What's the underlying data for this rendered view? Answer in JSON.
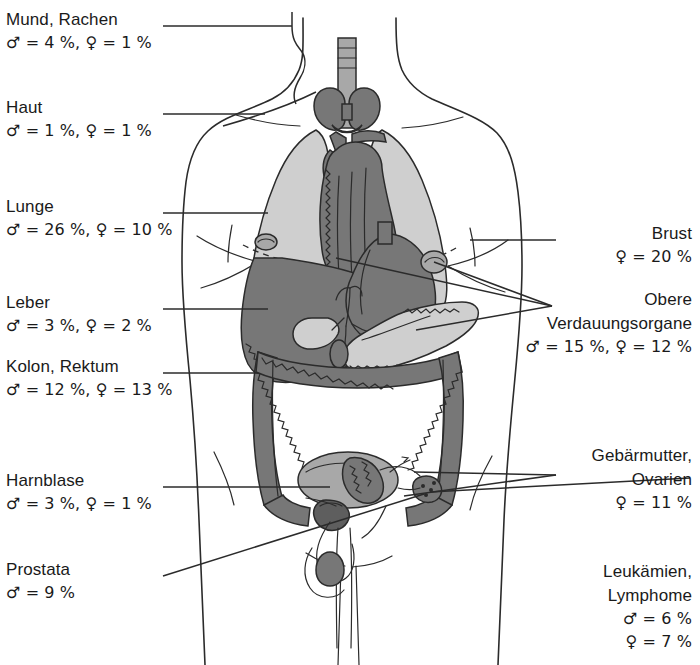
{
  "figure": {
    "colors": {
      "outline": "#2b2b2b",
      "organ_light": "#cfcfcf",
      "organ_mid": "#a8a8a8",
      "organ_dark": "#777777",
      "organ_darker": "#5e5e5e",
      "background": "#ffffff",
      "text": "#1a1a1a"
    },
    "symbols": {
      "male": "♂",
      "female": "♀"
    }
  },
  "labels_left": [
    {
      "name": "mund-rachen",
      "title": "Mund, Rachen",
      "stats": "♂ = 4 %, ♀ = 1 %",
      "male_pct": 4,
      "female_pct": 1
    },
    {
      "name": "haut",
      "title": "Haut",
      "stats": "♂ = 1 %, ♀ = 1 %",
      "male_pct": 1,
      "female_pct": 1
    },
    {
      "name": "lunge",
      "title": "Lunge",
      "stats": "♂ = 26 %, ♀ = 10 %",
      "male_pct": 26,
      "female_pct": 10
    },
    {
      "name": "leber",
      "title": "Leber",
      "stats": "♂ = 3 %, ♀ = 2 %",
      "male_pct": 3,
      "female_pct": 2
    },
    {
      "name": "kolon-rektum",
      "title": "Kolon, Rektum",
      "stats": "♂ = 12 %, ♀  = 13 %",
      "male_pct": 12,
      "female_pct": 13
    },
    {
      "name": "harnblase",
      "title": "Harnblase",
      "stats": "♂ = 3 %, ♀  = 1 %",
      "male_pct": 3,
      "female_pct": 1
    },
    {
      "name": "prostata",
      "title": "Prostata",
      "stats": "♂ = 9 %",
      "male_pct": 9,
      "female_pct": null
    }
  ],
  "labels_right": [
    {
      "name": "brust",
      "title": "Brust",
      "stats": "♀ = 20 %",
      "male_pct": null,
      "female_pct": 20
    },
    {
      "name": "obere-verdauungsorgane",
      "title": "Obere",
      "title2": "Verdauungsorgane",
      "stats": "♂ = 15 %, ♀ = 12 %",
      "male_pct": 15,
      "female_pct": 12
    },
    {
      "name": "gebaermutter-ovarien",
      "title": "Gebärmutter,",
      "title2": "Ovarien",
      "stats": "♀ = 11 %",
      "male_pct": null,
      "female_pct": 11
    },
    {
      "name": "leukaemien-lymphome",
      "title": "Leukämien,",
      "title2": "Lymphome",
      "stats": "♂ = 6 %",
      "stats2": "♀ = 7 %",
      "male_pct": 6,
      "female_pct": 7
    }
  ],
  "organs": [
    {
      "name": "thyroid-gland",
      "label": "Schilddrüse",
      "shade": "dark"
    },
    {
      "name": "trachea",
      "label": "Luftröhre",
      "shade": "mid"
    },
    {
      "name": "lung-right",
      "label": "Lunge rechts",
      "shade": "light"
    },
    {
      "name": "lung-left",
      "label": "Lunge links",
      "shade": "light"
    },
    {
      "name": "heart",
      "label": "Herz",
      "shade": "dark"
    },
    {
      "name": "liver",
      "label": "Leber",
      "shade": "dark"
    },
    {
      "name": "stomach",
      "label": "Magen",
      "shade": "dark"
    },
    {
      "name": "gallbladder",
      "label": "Gallenblase",
      "shade": "light"
    },
    {
      "name": "pancreas",
      "label": "Bauchspeicheldrüse",
      "shade": "light"
    },
    {
      "name": "colon",
      "label": "Dickdarm",
      "shade": "dark"
    },
    {
      "name": "kidney-right",
      "label": "Niere rechts",
      "shade": "mid"
    },
    {
      "name": "kidney-left",
      "label": "Niere links",
      "shade": "mid"
    },
    {
      "name": "bladder",
      "label": "Harnblase",
      "shade": "mid"
    },
    {
      "name": "uterus",
      "label": "Gebärmutter",
      "shade": "dark"
    },
    {
      "name": "ovary",
      "label": "Eierstock",
      "shade": "dark"
    },
    {
      "name": "prostate",
      "label": "Prostata",
      "shade": "darker"
    },
    {
      "name": "testis",
      "label": "Hoden",
      "shade": "dark"
    }
  ]
}
